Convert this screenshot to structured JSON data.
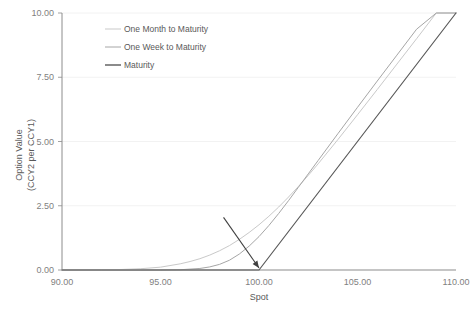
{
  "chart_data": {
    "type": "line",
    "title": "",
    "xlabel": "Spot",
    "ylabel": "Option Value (CCY2 per CCY1)",
    "ylabel_line1": "Option Value",
    "ylabel_line2": "(CCY2 per CCY1)",
    "xlim": [
      90.0,
      110.0
    ],
    "ylim": [
      0.0,
      10.0
    ],
    "xticks": [
      90.0,
      95.0,
      100.0,
      105.0,
      110.0
    ],
    "xtick_labels": [
      "90.00",
      "95.00",
      "100.00",
      "105.00",
      "110.00"
    ],
    "yticks": [
      0.0,
      2.5,
      5.0,
      7.5,
      10.0
    ],
    "ytick_labels": [
      "0.00",
      "2.50",
      "5.00",
      "7.50",
      "10.00"
    ],
    "grid": true,
    "grid_axis": "y",
    "legend_position": "top-center",
    "strike": 100.0,
    "annotation": {
      "type": "arrow",
      "label": "",
      "points_to_x": 100.0,
      "points_to_y": 0.0,
      "from_x": 98.2,
      "from_y": 2.05
    },
    "series": [
      {
        "name": "One Month to Maturity",
        "color": "#c9c9c9",
        "width": 1.0,
        "x": [
          90.0,
          91.0,
          92.0,
          93.0,
          94.0,
          95.0,
          96.0,
          96.5,
          97.0,
          97.5,
          98.0,
          98.5,
          99.0,
          99.5,
          100.0,
          100.5,
          101.0,
          101.5,
          102.0,
          102.5,
          103.0,
          104.0,
          105.0,
          106.0,
          107.0,
          108.0,
          109.0,
          110.0
        ],
        "y": [
          0.0,
          0.0,
          0.01,
          0.02,
          0.05,
          0.11,
          0.24,
          0.33,
          0.44,
          0.58,
          0.75,
          0.95,
          1.19,
          1.46,
          1.76,
          2.09,
          2.45,
          2.84,
          3.25,
          3.68,
          4.13,
          5.07,
          6.04,
          7.02,
          8.01,
          9.0,
          10.0,
          10.0
        ]
      },
      {
        "name": "One Week to Maturity",
        "color": "#a6a6a6",
        "width": 1.0,
        "x": [
          90.0,
          92.0,
          94.0,
          95.0,
          96.0,
          97.0,
          97.5,
          98.0,
          98.5,
          99.0,
          99.5,
          100.0,
          100.5,
          101.0,
          101.5,
          102.0,
          102.5,
          103.0,
          104.0,
          105.0,
          106.0,
          107.0,
          108.0,
          109.0,
          110.0
        ],
        "y": [
          0.0,
          0.0,
          0.0,
          0.0,
          0.01,
          0.06,
          0.12,
          0.22,
          0.38,
          0.62,
          0.93,
          1.3,
          1.73,
          2.2,
          2.7,
          3.22,
          3.74,
          4.26,
          5.3,
          6.33,
          7.35,
          8.36,
          9.37,
          10.0,
          10.0
        ]
      },
      {
        "name": "Maturity",
        "color": "#595959",
        "width": 1.2,
        "x": [
          90.0,
          100.0,
          110.0
        ],
        "y": [
          0.0,
          0.0,
          10.0
        ]
      }
    ]
  },
  "legend": {
    "items": [
      {
        "label": "One Month to Maturity",
        "color": "#c9c9c9"
      },
      {
        "label": "One Week to Maturity",
        "color": "#a6a6a6"
      },
      {
        "label": "Maturity",
        "color": "#595959"
      }
    ]
  },
  "colors": {
    "axis": "#8c8c8c",
    "grid": "#f2f2f2",
    "text": "#595959",
    "tick_text": "#7f7f7f",
    "background": "#ffffff",
    "annotation": "#404040"
  }
}
